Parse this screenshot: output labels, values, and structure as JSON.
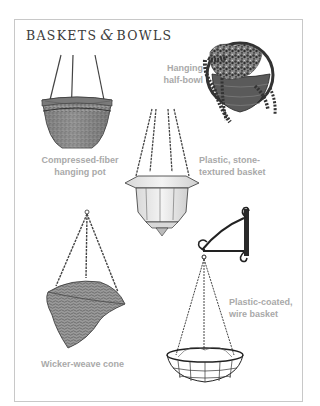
{
  "page": {
    "title_part1": "BASKETS",
    "title_amp": "&",
    "title_part2": "BOWLS"
  },
  "items": [
    {
      "id": "hanging-half-bowl",
      "label_line1": "Hanging",
      "label_line2": "half-bowl",
      "icon": "half-bowl-with-trailing-plant"
    },
    {
      "id": "compressed-fiber-pot",
      "label_line1": "Compressed-fiber",
      "label_line2": "hanging pot",
      "icon": "fiber-pot-on-wires"
    },
    {
      "id": "stone-textured-basket",
      "label_line1": "Plastic, stone-",
      "label_line2": "textured basket",
      "icon": "octagonal-basket-on-chains"
    },
    {
      "id": "wicker-cone",
      "label_line1": "Wicker-weave cone",
      "label_line2": "",
      "icon": "wicker-cone-on-chains"
    },
    {
      "id": "wire-basket",
      "label_line1": "Plastic-coated,",
      "label_line2": "wire basket",
      "icon": "wire-basket-on-wall-bracket"
    }
  ],
  "colors": {
    "label_text": "#a9a9a9",
    "title_text": "#3a3a3a",
    "frame_border": "#c8c8c8",
    "ink": "#2a2a2a"
  }
}
